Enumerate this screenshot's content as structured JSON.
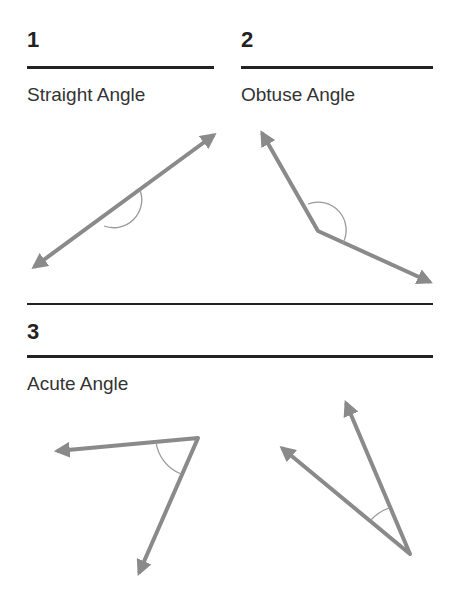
{
  "sections": [
    {
      "number": "1",
      "label": "Straight Angle"
    },
    {
      "number": "2",
      "label": "Obtuse Angle"
    },
    {
      "number": "3",
      "label": "Acute Angle"
    }
  ],
  "colors": {
    "ray": "#8a8a8a",
    "arc": "#999999",
    "rule": "#222222"
  }
}
